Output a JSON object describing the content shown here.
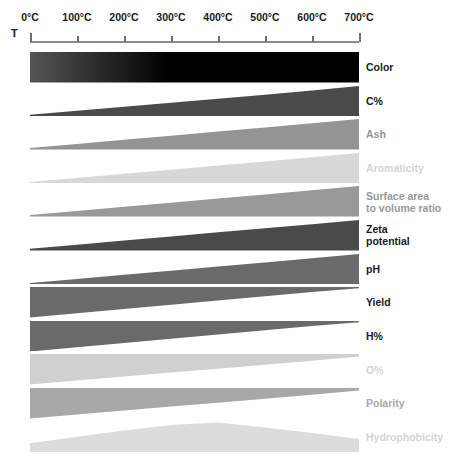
{
  "figure": {
    "axis": {
      "variable_label": "T",
      "unit": "°C",
      "tick_labels": [
        "0°C",
        "100°C",
        "200°C",
        "300°C",
        "400°C",
        "500°C",
        "600°C",
        "700°C"
      ],
      "tick_values": [
        0,
        100,
        200,
        300,
        400,
        500,
        600,
        700
      ],
      "range": [
        0,
        700
      ],
      "line_color": "#8c8c8c",
      "tick_color": "#6e6e6e"
    },
    "chart_data": {
      "type": "area",
      "title": "",
      "subtitle": "",
      "xlabel": "T",
      "ylabel": "",
      "xlim": [
        0,
        700
      ],
      "grid": false,
      "legend": "right-labels",
      "x": [
        0,
        100,
        200,
        300,
        400,
        500,
        600,
        700
      ],
      "description": "Qualitative wedge chart: each band's thickness encodes the relative magnitude of a biochar property across pyrolysis temperature.",
      "series": [
        {
          "name": "Color",
          "label": "Color",
          "label_color": "#1a1a1a",
          "color": "#111111",
          "shape": "gradient-bar",
          "anchor": "full",
          "trend": "darkens with temperature",
          "values": [
            0.55,
            0.7,
            0.88,
            1.0,
            1.0,
            1.0,
            1.0,
            1.0
          ],
          "gradient_from": "#555555",
          "gradient_to": "#000000",
          "gradient_mid_pct": 42
        },
        {
          "name": "C%",
          "label": "C%",
          "label_color": "#1a1a1a",
          "color": "#4a4a4a",
          "shape": "wedge",
          "anchor": "bottom",
          "trend": "increasing",
          "values": [
            0.06,
            0.19,
            0.32,
            0.45,
            0.58,
            0.71,
            0.85,
            1.0
          ]
        },
        {
          "name": "Ash",
          "label": "Ash",
          "label_color": "#949494",
          "color": "#949494",
          "shape": "wedge",
          "anchor": "bottom",
          "trend": "increasing",
          "values": [
            0.05,
            0.18,
            0.32,
            0.45,
            0.59,
            0.72,
            0.86,
            1.0
          ]
        },
        {
          "name": "Aromaticity",
          "label": "Aromaticity",
          "label_color": "#d4d4d4",
          "color": "#d8d8d8",
          "shape": "wedge",
          "anchor": "bottom",
          "trend": "increasing",
          "values": [
            0.05,
            0.18,
            0.32,
            0.45,
            0.59,
            0.72,
            0.86,
            1.0
          ]
        },
        {
          "name": "Surface area to volume ratio",
          "label": "Surface area\nto volume ratio",
          "label_color": "#999999",
          "color": "#999999",
          "shape": "wedge",
          "anchor": "bottom",
          "trend": "increasing",
          "values": [
            0.05,
            0.18,
            0.32,
            0.45,
            0.59,
            0.72,
            0.86,
            1.0
          ]
        },
        {
          "name": "Zeta potential",
          "label": "Zeta\npotential",
          "label_color": "#1a1a1a",
          "color": "#4a4a4a",
          "shape": "wedge",
          "anchor": "bottom",
          "trend": "increasing",
          "values": [
            0.06,
            0.19,
            0.33,
            0.46,
            0.6,
            0.73,
            0.86,
            1.0
          ]
        },
        {
          "name": "pH",
          "label": "pH",
          "label_color": "#1a1a1a",
          "color": "#6a6a6a",
          "shape": "wedge",
          "anchor": "bottom",
          "trend": "increasing",
          "values": [
            0.05,
            0.18,
            0.32,
            0.45,
            0.59,
            0.72,
            0.86,
            1.0
          ]
        },
        {
          "name": "Yield",
          "label": "Yield",
          "label_color": "#1a1a1a",
          "color": "#6a6a6a",
          "shape": "wedge",
          "anchor": "top",
          "trend": "decreasing",
          "values": [
            1.0,
            0.86,
            0.72,
            0.58,
            0.44,
            0.3,
            0.16,
            0.04
          ]
        },
        {
          "name": "H%",
          "label": "H%",
          "label_color": "#1a1a1a",
          "color": "#6a6a6a",
          "shape": "wedge",
          "anchor": "top",
          "trend": "decreasing",
          "values": [
            1.0,
            0.86,
            0.72,
            0.58,
            0.44,
            0.3,
            0.16,
            0.04
          ]
        },
        {
          "name": "O%",
          "label": "O%",
          "label_color": "#d4d4d4",
          "color": "#d0d0d0",
          "shape": "wedge",
          "anchor": "top",
          "trend": "decreasing",
          "values": [
            1.0,
            0.87,
            0.74,
            0.61,
            0.48,
            0.35,
            0.22,
            0.08
          ]
        },
        {
          "name": "Polarity",
          "label": "Polarity",
          "label_color": "#a8a8a8",
          "color": "#a8a8a8",
          "shape": "wedge",
          "anchor": "top",
          "trend": "decreasing",
          "values": [
            1.0,
            0.87,
            0.74,
            0.61,
            0.48,
            0.35,
            0.22,
            0.08
          ]
        },
        {
          "name": "Hydrophobicity",
          "label": "Hydrophobicity",
          "label_color": "#d4d4d4",
          "color": "#dcdcdc",
          "shape": "peak",
          "anchor": "bottom",
          "trend": "rises to a maximum near 350-400°C then declines",
          "values": [
            0.3,
            0.52,
            0.72,
            0.9,
            0.98,
            0.82,
            0.64,
            0.44
          ]
        }
      ]
    }
  }
}
